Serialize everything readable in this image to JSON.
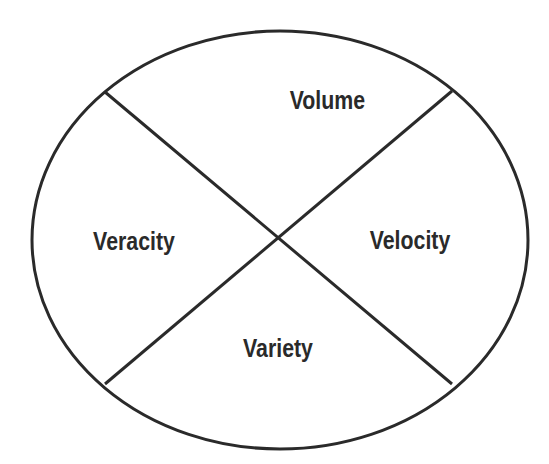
{
  "diagram": {
    "type": "ellipse-quadrants",
    "stroke_color": "#2a2a2a",
    "background": "#ffffff",
    "ellipse": {
      "cx": 280,
      "cy": 240,
      "rx": 248,
      "ry": 209
    },
    "center": {
      "x": 275,
      "y": 238
    },
    "lines": [
      {
        "x1": 105,
        "y1": 92,
        "x2": 452,
        "y2": 384
      },
      {
        "x1": 452,
        "y1": 91,
        "x2": 105,
        "y2": 384
      }
    ],
    "quadrants": [
      {
        "position": "top",
        "label": "Volume",
        "x": 278,
        "y": 100
      },
      {
        "position": "right",
        "label": "Velocity",
        "x": 410,
        "y": 240
      },
      {
        "position": "bottom",
        "label": "Variety",
        "x": 278,
        "y": 348
      },
      {
        "position": "left",
        "label": "Veracity",
        "x": 134,
        "y": 241
      }
    ]
  }
}
